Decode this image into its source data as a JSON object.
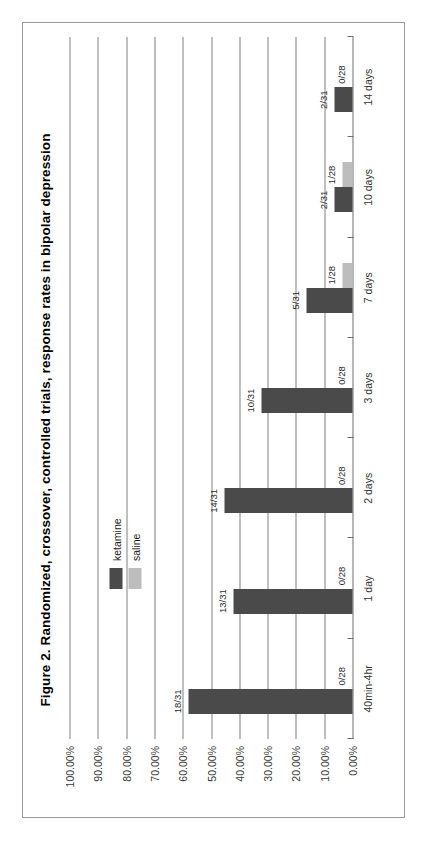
{
  "figure": {
    "title": "Figure 2. Randomized, crossover, controlled trials, response rates in bipolar depression",
    "orientation": "rotated-90-ccw",
    "frame_color": "#9a9a9a"
  },
  "legend": {
    "position": "upper-left-inside",
    "entries": [
      {
        "label": "ketamine",
        "color": "#4a4a4a"
      },
      {
        "label": "saline",
        "color": "#bdbdbd"
      }
    ]
  },
  "chart_data": {
    "type": "bar",
    "title": "Figure 2. Randomized, crossover, controlled trials, response rates in bipolar depression",
    "xlabel": "",
    "ylabel": "",
    "grid": true,
    "legend_position": "upper-left-inside",
    "categories": [
      "40min-4hr",
      "1 day",
      "2 days",
      "3 days",
      "7 days",
      "10 days",
      "14 days"
    ],
    "ylim": [
      0,
      100
    ],
    "ytick_labels": [
      "100.00%",
      "90.00%",
      "80.00%",
      "70.00%",
      "60.00%",
      "50.00%",
      "40.00%",
      "30.00%",
      "20.00%",
      "10.00%",
      "0.00%"
    ],
    "ytick_values": [
      100,
      90,
      80,
      70,
      60,
      50,
      40,
      30,
      20,
      10,
      0
    ],
    "series": [
      {
        "name": "ketamine",
        "color": "#4a4a4a",
        "values": [
          58.06,
          41.94,
          45.16,
          32.26,
          16.13,
          6.45,
          6.45
        ],
        "data_labels": [
          "18/31",
          "13/31",
          "14/31",
          "10/31",
          "5/31",
          "2/31",
          "2/31"
        ]
      },
      {
        "name": "saline",
        "color": "#bdbdbd",
        "values": [
          0.0,
          0.0,
          0.0,
          0.0,
          3.57,
          3.57,
          0.0
        ],
        "data_labels": [
          "0/28",
          "0/28",
          "0/28",
          "0/28",
          "1/28",
          "1/28",
          "0/28"
        ]
      }
    ]
  }
}
